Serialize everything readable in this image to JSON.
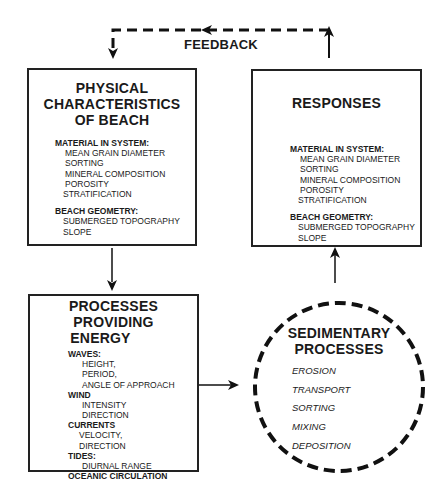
{
  "feedback": {
    "label": "FEEDBACK"
  },
  "physical": {
    "title_lines": [
      "PHYSICAL",
      "CHARACTERISTICS",
      "OF BEACH"
    ],
    "sections": [
      {
        "heading": "MATERIAL IN SYSTEM:",
        "items": [
          "MEAN GRAIN DIAMETER",
          "SORTING",
          "MINERAL COMPOSITION",
          "POROSITY",
          "STRATIFICATION"
        ]
      },
      {
        "heading": "BEACH GEOMETRY:",
        "items": [
          "SUBMERGED TOPOGRAPHY",
          "SLOPE"
        ]
      }
    ]
  },
  "responses": {
    "title": "RESPONSES",
    "sections": [
      {
        "heading": "MATERIAL IN SYSTEM:",
        "items": [
          "MEAN GRAIN DIAMETER",
          "SORTING",
          "MINERAL COMPOSITION",
          "POROSITY",
          "STRATIFICATION"
        ]
      },
      {
        "heading": "BEACH GEOMETRY:",
        "items": [
          "SUBMERGED TOPOGRAPHY",
          "SLOPE"
        ]
      }
    ]
  },
  "processes": {
    "title_lines": [
      "PROCESSES PROVIDING",
      "ENERGY"
    ],
    "sections": [
      {
        "heading": "WAVES:",
        "items": [
          "HEIGHT,",
          "PERIOD,",
          "ANGLE OF APPROACH"
        ]
      },
      {
        "heading": "WIND",
        "items": [
          "INTENSITY",
          "DIRECTION"
        ]
      },
      {
        "heading": "CURRENTS",
        "items": [
          "VELOCITY,",
          "DIRECTION"
        ]
      },
      {
        "heading": "TIDES:",
        "items": [
          "DIURNAL RANGE"
        ]
      },
      {
        "heading": "OCEANIC CIRCULATION",
        "items": []
      }
    ]
  },
  "sedimentary": {
    "title_lines": [
      "SEDIMENTARY",
      "PROCESSES"
    ],
    "items": [
      "EROSION",
      "TRANSPORT",
      "SORTING",
      "MIXING",
      "DEPOSITION"
    ]
  }
}
